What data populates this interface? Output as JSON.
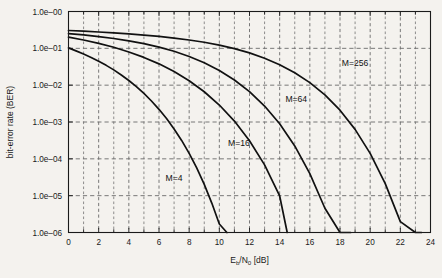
{
  "chart_data": {
    "type": "line",
    "title": "",
    "xlabel": "Eb/N0 [dB]",
    "xlabel_parts": {
      "e": "E",
      "b": "b",
      "slash": "/N",
      "zero": "0",
      "unit": " [dB]"
    },
    "ylabel": "bit-error rate (BER)",
    "xlim": [
      0,
      24
    ],
    "ylim": [
      1e-06,
      1
    ],
    "yscale": "log",
    "grid": true,
    "grid_style": "dashed",
    "legend": "inline-annotations",
    "xticks": [
      0,
      2,
      4,
      6,
      8,
      10,
      12,
      14,
      16,
      18,
      20,
      22,
      24
    ],
    "xticklabels": [
      "0",
      "2",
      "4",
      "6",
      "8",
      "10",
      "12",
      "14",
      "16",
      "18",
      "20",
      "22",
      "24"
    ],
    "xminor_step": 1,
    "yticks": [
      1,
      0.1,
      0.01,
      0.001,
      0.0001,
      1e-05,
      1e-06
    ],
    "yticklabels": [
      "1.0e–00",
      "1.0e–01",
      "1.0e–02",
      "1.0e–03",
      "1.0e–04",
      "1.0e–05",
      "1.0e–06"
    ],
    "series": [
      {
        "name": "M=4",
        "label": "M=4",
        "label_x": 7.0,
        "label_y": 2.5e-05,
        "color": "#111111",
        "x": [
          0,
          0.5,
          1,
          1.5,
          2,
          2.5,
          3,
          3.5,
          4,
          4.5,
          5,
          5.5,
          6,
          6.5,
          7,
          7.5,
          8,
          8.5,
          9,
          9.5,
          10,
          10.5
        ],
        "y": [
          0.103,
          0.0855,
          0.0705,
          0.0567,
          0.0448,
          0.0345,
          0.026,
          0.0189,
          0.0134,
          0.00909,
          0.00595,
          0.00372,
          0.00221,
          0.00124,
          0.000649,
          0.000316,
          0.000141,
          5.67e-05,
          2.03e-05,
          6.3e-06,
          1.7e-06,
          1e-06
        ]
      },
      {
        "name": "M=16",
        "label": "M=16",
        "label_x": 11.3,
        "label_y": 0.00022,
        "color": "#111111",
        "x": [
          0,
          1,
          2,
          3,
          4,
          5,
          6,
          7,
          8,
          9,
          10,
          11,
          12,
          13,
          14,
          14.5
        ],
        "y": [
          0.201,
          0.168,
          0.136,
          0.107,
          0.0798,
          0.0567,
          0.0379,
          0.0235,
          0.0132,
          0.00663,
          0.00289,
          0.00106,
          0.000311,
          6.86e-05,
          9.8e-06,
          1e-06
        ]
      },
      {
        "name": "M=64",
        "label": "M=64",
        "label_x": 15.1,
        "label_y": 0.0036,
        "color": "#111111",
        "x": [
          0,
          1,
          2,
          3,
          4,
          5,
          6,
          7,
          8,
          9,
          10,
          11,
          12,
          13,
          14,
          15,
          16,
          17,
          18,
          18.7
        ],
        "y": [
          0.252,
          0.231,
          0.209,
          0.185,
          0.16,
          0.134,
          0.108,
          0.0833,
          0.0602,
          0.0405,
          0.025,
          0.0138,
          0.00665,
          0.00271,
          0.000893,
          0.000224,
          3.98e-05,
          4.55e-06,
          3.3e-07,
          1e-06
        ]
      },
      {
        "name": "M=256",
        "label": "M=256",
        "label_x": 19.0,
        "label_y": 0.033,
        "color": "#111111",
        "x": [
          0,
          1,
          2,
          3,
          4,
          5,
          6,
          7,
          8,
          9,
          10,
          11,
          12,
          13,
          14,
          15,
          16,
          17,
          18,
          19,
          20,
          21,
          22,
          23,
          23.4
        ],
        "y": [
          0.305,
          0.292,
          0.278,
          0.263,
          0.247,
          0.229,
          0.21,
          0.19,
          0.168,
          0.146,
          0.122,
          0.0982,
          0.0751,
          0.0539,
          0.0359,
          0.0218,
          0.0117,
          0.00543,
          0.00209,
          0.000631,
          0.000141,
          2.13e-05,
          1.97e-06,
          1e-07,
          1e-06
        ]
      }
    ]
  }
}
